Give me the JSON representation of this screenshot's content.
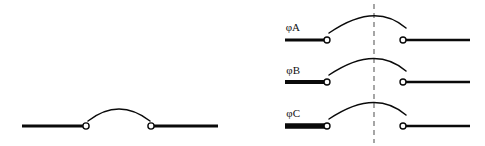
{
  "figure": {
    "background_color": "#ffffff",
    "line_color": "#0a0a0a",
    "dash_color": "#6b6b6b",
    "terminal_fill": "#ffffff"
  },
  "left_diagram": {
    "name": "single-pole-open-contact",
    "left_bar": {
      "x1": 22,
      "x2": 85,
      "y": 126,
      "thickness": 3.2
    },
    "right_bar": {
      "x1": 152,
      "x2": 218,
      "y": 126,
      "thickness": 3.2
    },
    "left_terminal": {
      "cx": 86,
      "cy": 126,
      "r": 3.1
    },
    "right_terminal": {
      "cx": 151,
      "cy": 126,
      "r": 3.1
    },
    "arc": {
      "path": "M 88 121 Q 119 97 150 121"
    }
  },
  "right_diagram": {
    "name": "three-phase-open-contacts",
    "dashed_center_line": {
      "x": 374,
      "y1": 4,
      "y2": 143
    },
    "rows": [
      {
        "label": "φA",
        "label_x": 300,
        "label_y": 28,
        "y": 40,
        "left_bar": {
          "x1": 285,
          "x2": 326,
          "thickness": 3.0
        },
        "right_bar": {
          "x1": 404,
          "x2": 470,
          "thickness": 2.4
        },
        "left_terminal": {
          "cx": 327,
          "r": 3.0
        },
        "right_terminal": {
          "cx": 403,
          "r": 3.0
        },
        "arc": {
          "path": "M 329 33 Q 375 1 406 28"
        }
      },
      {
        "label": "φB",
        "label_x": 300,
        "label_y": 71,
        "y": 82,
        "left_bar": {
          "x1": 285,
          "x2": 326,
          "thickness": 4.2
        },
        "right_bar": {
          "x1": 404,
          "x2": 470,
          "thickness": 2.4
        },
        "left_terminal": {
          "cx": 327,
          "r": 3.0
        },
        "right_terminal": {
          "cx": 403,
          "r": 3.0
        },
        "arc": {
          "path": "M 329 75 Q 375 44 406 71"
        }
      },
      {
        "label": "φC",
        "label_x": 300,
        "label_y": 114,
        "y": 126,
        "left_bar": {
          "x1": 285,
          "x2": 326,
          "thickness": 5.4
        },
        "right_bar": {
          "x1": 404,
          "x2": 470,
          "thickness": 2.4
        },
        "left_terminal": {
          "cx": 327,
          "r": 3.0
        },
        "right_terminal": {
          "cx": 403,
          "r": 3.0
        },
        "arc": {
          "path": "M 329 119 Q 375 88 406 115"
        }
      }
    ]
  }
}
